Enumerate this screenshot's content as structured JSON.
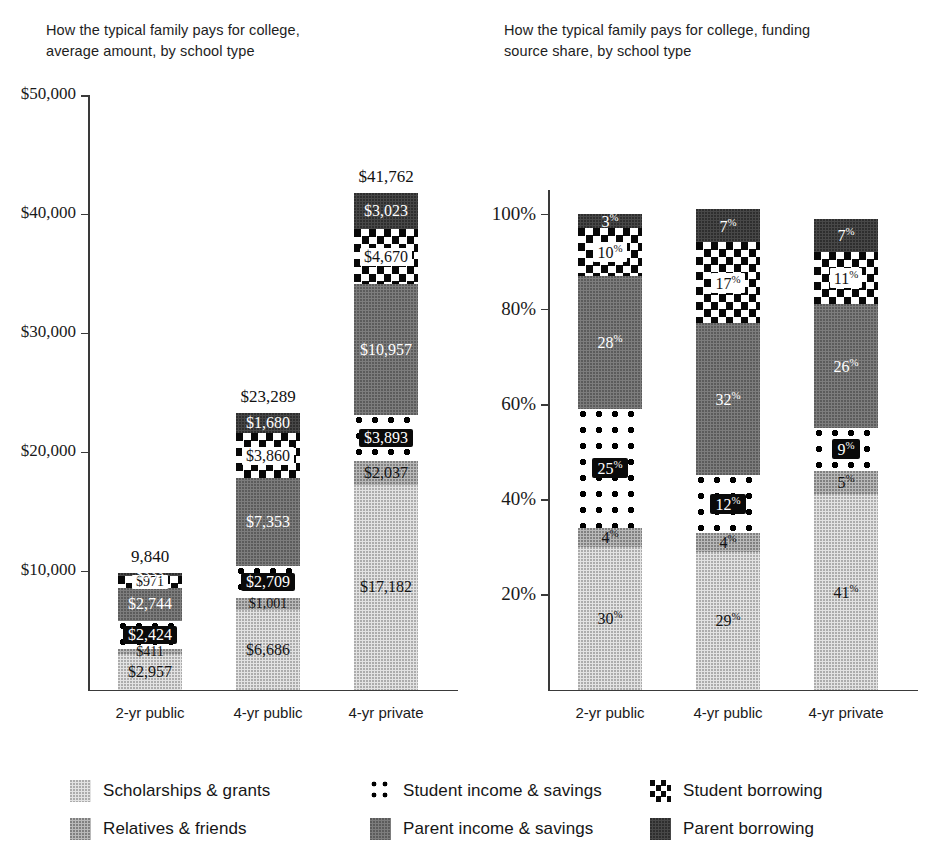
{
  "charts": {
    "left": {
      "title": "How the typical family pays for college,\naverage amount, by school type",
      "title_line1": "How the typical family pays for college,",
      "title_line2": "average amount, by school type",
      "y_ticks": [
        "$50,000",
        "$40,000",
        "$30,000",
        "$20,000",
        "$10,000"
      ],
      "categories": [
        "2-yr public",
        "4-yr public",
        "4-yr private"
      ],
      "totals": [
        "9,840",
        "$23,289",
        "$41,762"
      ],
      "values": {
        "2-yr public": {
          "Scholarships & grants": "$2,957",
          "Relatives & friends": "$411",
          "Student income & savings": "$2,424",
          "Parent income & savings": "$2,744",
          "Student borrowing": "$971",
          "Parent borrowing": "$333"
        },
        "4-yr public": {
          "Scholarships & grants": "$6,686",
          "Relatives & friends": "$1,001",
          "Student income & savings": "$2,709",
          "Parent income & savings": "$7,353",
          "Student borrowing": "$3,860",
          "Parent borrowing": "$1,680"
        },
        "4-yr private": {
          "Scholarships & grants": "$17,182",
          "Relatives & friends": "$2,037",
          "Student income & savings": "$3,893",
          "Parent income & savings": "$10,957",
          "Student borrowing": "$4,670",
          "Parent borrowing": "$3,023"
        }
      }
    },
    "right": {
      "title_line1": "How the typical family pays for college, funding",
      "title_line2": "source share, by school type",
      "y_ticks": [
        "100%",
        "80%",
        "60%",
        "40%",
        "20%"
      ],
      "categories": [
        "2-yr public",
        "4-yr public",
        "4-yr private"
      ],
      "values": {
        "2-yr public": {
          "Scholarships & grants": "30",
          "Relatives & friends": "4",
          "Student income & savings": "25",
          "Parent income & savings": "28",
          "Student borrowing": "10",
          "Parent borrowing": "3"
        },
        "4-yr public": {
          "Scholarships & grants": "29",
          "Relatives & friends": "4",
          "Student income & savings": "12",
          "Parent income & savings": "32",
          "Student borrowing": "17",
          "Parent borrowing": "7"
        },
        "4-yr private": {
          "Scholarships & grants": "41",
          "Relatives & friends": "5",
          "Student income & savings": "9",
          "Parent income & savings": "26",
          "Student borrowing": "11",
          "Parent borrowing": "7"
        }
      }
    }
  },
  "legend": {
    "items": [
      {
        "label": "Scholarships & grants",
        "swatch": "light-gray-dotted-swatch"
      },
      {
        "label": "Student income & savings",
        "swatch": "white-polka-dot-swatch"
      },
      {
        "label": "Student borrowing",
        "swatch": "black-checkerboard-swatch"
      },
      {
        "label": "Relatives & friends",
        "swatch": "medium-gray-swatch"
      },
      {
        "label": "Parent income & savings",
        "swatch": "dark-gray-swatch"
      },
      {
        "label": "Parent borrowing",
        "swatch": "charcoal-swatch"
      }
    ]
  },
  "chart_data": {
    "type": "bar",
    "subtype": "stacked-bar",
    "charts": [
      {
        "id": "average-amount",
        "title": "How the typical family pays for college, average amount, by school type",
        "xlabel": "",
        "ylabel": "",
        "ylim": [
          0,
          50000
        ],
        "y_tick_values": [
          10000,
          20000,
          30000,
          40000,
          50000
        ],
        "y_tick_labels": [
          "$10,000",
          "$20,000",
          "$30,000",
          "$40,000",
          "$50,000"
        ],
        "grid": false,
        "legend_position": "bottom",
        "categories": [
          "2-yr public",
          "4-yr public",
          "4-yr private"
        ],
        "stack_order_bottom_to_top": [
          "Scholarships & grants",
          "Relatives & friends",
          "Student income & savings",
          "Parent income & savings",
          "Student borrowing",
          "Parent borrowing"
        ],
        "series": [
          {
            "name": "Scholarships & grants",
            "values": [
              2957,
              6686,
              17182
            ],
            "labels": [
              "$2,957",
              "$6,686",
              "$17,182"
            ]
          },
          {
            "name": "Relatives & friends",
            "values": [
              411,
              1001,
              2037
            ],
            "labels": [
              "$411",
              "$1,001",
              "$2,037"
            ]
          },
          {
            "name": "Student income & savings",
            "values": [
              2424,
              2709,
              3893
            ],
            "labels": [
              "$2,424",
              "$2,709",
              "$3,893"
            ]
          },
          {
            "name": "Parent income & savings",
            "values": [
              2744,
              7353,
              10957
            ],
            "labels": [
              "$2,744",
              "$7,353",
              "$10,957"
            ]
          },
          {
            "name": "Student borrowing",
            "values": [
              971,
              3860,
              4670
            ],
            "labels": [
              "$971",
              "$3,860",
              "$4,670"
            ]
          },
          {
            "name": "Parent borrowing",
            "values": [
              333,
              1680,
              3023
            ],
            "labels": [
              "$333",
              "$1,680",
              "$3,023"
            ]
          }
        ],
        "totals": [
          9840,
          23289,
          41762
        ],
        "total_labels": [
          "9,840",
          "$23,289",
          "$41,762"
        ]
      },
      {
        "id": "funding-source-share",
        "title": "How the typical family pays for college, funding source share, by school type",
        "xlabel": "",
        "ylabel": "",
        "ylim": [
          0,
          100
        ],
        "y_tick_values": [
          20,
          40,
          60,
          80,
          100
        ],
        "y_tick_labels": [
          "20%",
          "40%",
          "60%",
          "80%",
          "100%"
        ],
        "grid": false,
        "legend_position": "bottom",
        "categories": [
          "2-yr public",
          "4-yr public",
          "4-yr private"
        ],
        "stack_order_bottom_to_top": [
          "Scholarships & grants",
          "Relatives & friends",
          "Student income & savings",
          "Parent income & savings",
          "Student borrowing",
          "Parent borrowing"
        ],
        "series": [
          {
            "name": "Scholarships & grants",
            "values": [
              30,
              29,
              41
            ],
            "labels": [
              "30%",
              "29%",
              "41%"
            ]
          },
          {
            "name": "Relatives & friends",
            "values": [
              4,
              4,
              5
            ],
            "labels": [
              "4%",
              "4%",
              "5%"
            ]
          },
          {
            "name": "Student income & savings",
            "values": [
              25,
              12,
              9
            ],
            "labels": [
              "25%",
              "12%",
              "9%"
            ]
          },
          {
            "name": "Parent income & savings",
            "values": [
              28,
              32,
              26
            ],
            "labels": [
              "28%",
              "32%",
              "26%"
            ]
          },
          {
            "name": "Student borrowing",
            "values": [
              10,
              17,
              11
            ],
            "labels": [
              "10%",
              "17%",
              "11%"
            ]
          },
          {
            "name": "Parent borrowing",
            "values": [
              3,
              7,
              7
            ],
            "labels": [
              "3%",
              "7%",
              "7%"
            ]
          }
        ],
        "totals": [
          100,
          101,
          99
        ]
      }
    ]
  }
}
